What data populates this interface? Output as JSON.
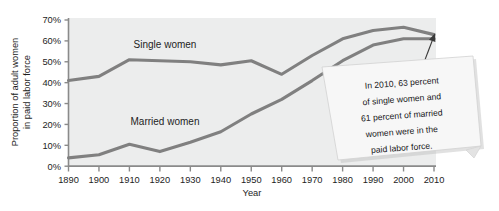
{
  "chart_data": {
    "type": "line",
    "title": "",
    "xlabel": "Year",
    "ylabel": "Proportion of adult women in paid labor force",
    "ylabel_line1": "Proportion of adult women",
    "ylabel_line2": "in paid labor force",
    "x": [
      1890,
      1900,
      1910,
      1920,
      1930,
      1940,
      1950,
      1960,
      1970,
      1980,
      1990,
      2000,
      2010
    ],
    "xticklabels": [
      "1890",
      "1900",
      "1910",
      "1920",
      "1930",
      "1940",
      "1950",
      "1960",
      "1970",
      "1980",
      "1990",
      "2000",
      "2010"
    ],
    "yticklabels": [
      "0%",
      "10%",
      "20%",
      "30%",
      "40%",
      "50%",
      "60%",
      "70%"
    ],
    "ytickvalues": [
      0,
      10,
      20,
      30,
      40,
      50,
      60,
      70
    ],
    "xlim": [
      1890,
      2010
    ],
    "ylim": [
      0,
      70
    ],
    "grid": false,
    "legend_position": "inline-labels",
    "series": [
      {
        "name": "Single women",
        "label": "Single women",
        "color": "#808080",
        "values": [
          41,
          43,
          51,
          50.5,
          50,
          48.5,
          50.5,
          44,
          53,
          61,
          65,
          66.5,
          63
        ]
      },
      {
        "name": "Married women",
        "label": "Married women",
        "color": "#808080",
        "values": [
          4,
          5.5,
          10.5,
          7,
          11.5,
          16.5,
          25,
          32,
          41,
          50.5,
          58,
          61,
          61
        ]
      }
    ],
    "annotation": {
      "text": "In 2010, 63 percent of single women and 61 percent of married women were in the paid labor force.",
      "lines": [
        "In 2010, 63 percent",
        "of single women and",
        "61 percent of married",
        "women were in the",
        "paid labor force."
      ],
      "points_to_year": 2010
    },
    "colors": {
      "line": "#808080",
      "plot_background": "#eceded",
      "axis": "#8a8a8a",
      "text": "#1d1d1d",
      "note_background": "#f7f7f7",
      "note_border": "#cfcfcf",
      "leader_line": "#3a3a3a"
    }
  }
}
